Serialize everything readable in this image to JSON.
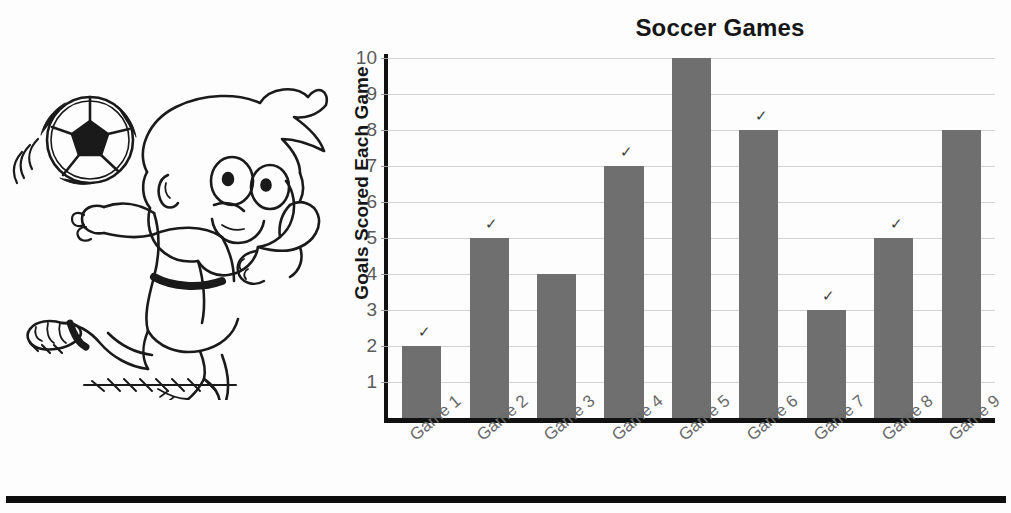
{
  "worksheet": {
    "bottom_rule": "horizontal-divider"
  },
  "illustration": {
    "name": "boy-kicking-soccer-ball",
    "ball": "soccer-ball",
    "motion_lines": "motion-arcs",
    "ground_shadow": "ground-hatching"
  },
  "chart_data": {
    "type": "bar",
    "title": "Soccer Games",
    "xlabel": "",
    "ylabel": "Goals Scored Each Game",
    "categories": [
      "Game 1",
      "Game 2",
      "Game 3",
      "Game 4",
      "Game 5",
      "Game 6",
      "Game 7",
      "Game 8",
      "Game 9"
    ],
    "values": [
      2,
      5,
      4,
      7,
      10,
      8,
      3,
      5,
      8
    ],
    "ylim": [
      0,
      10
    ],
    "yticks": [
      1,
      2,
      3,
      4,
      5,
      6,
      7,
      8,
      9,
      10
    ],
    "ytick_labels": [
      "1",
      "2",
      "3",
      "4",
      "5",
      "6",
      "7",
      "8",
      "9",
      "10"
    ],
    "grid": true,
    "legend": null,
    "bar_color": "#6f6f6f",
    "grid_color": "#d2d2d2",
    "axis_color": "#111111",
    "annotations": [
      {
        "label": "pencil-check",
        "near": "Game 1"
      },
      {
        "label": "pencil-check",
        "near": "Game 2"
      },
      {
        "label": "pencil-check",
        "near": "Game 4"
      },
      {
        "label": "pencil-check",
        "near": "Game 6"
      },
      {
        "label": "pencil-check",
        "near": "Game 7"
      },
      {
        "label": "pencil-check",
        "near": "Game 8"
      }
    ]
  }
}
